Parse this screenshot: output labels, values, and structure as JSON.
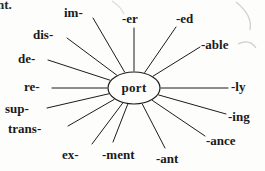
{
  "page": {
    "background_color": "#fdfdfc",
    "ink_color": "#1a1a1a",
    "clipped_fragment": "nt."
  },
  "diagram": {
    "type": "word-web",
    "center": {
      "word": "port",
      "cx": 134,
      "cy": 88,
      "rx": 26,
      "ry": 16
    },
    "spokes": [
      {
        "label": "im-",
        "name": "affix-im",
        "text_x": 64,
        "text_y": 6,
        "line_x": 93,
        "line_y": 18,
        "align": "left"
      },
      {
        "label": "-er",
        "name": "affix-er",
        "text_x": 122,
        "text_y": 12,
        "line_x": 134,
        "line_y": 28,
        "align": "left"
      },
      {
        "label": "-ed",
        "name": "affix-ed",
        "text_x": 176,
        "text_y": 12,
        "line_x": 176,
        "line_y": 27,
        "align": "left"
      },
      {
        "label": "-able",
        "name": "affix-able",
        "text_x": 201,
        "text_y": 38,
        "line_x": 200,
        "line_y": 47,
        "align": "left"
      },
      {
        "label": "-ly",
        "name": "affix-ly",
        "text_x": 231,
        "text_y": 80,
        "line_x": 228,
        "line_y": 88,
        "align": "left"
      },
      {
        "label": "-ing",
        "name": "affix-ing",
        "text_x": 228,
        "text_y": 110,
        "line_x": 226,
        "line_y": 114,
        "align": "left"
      },
      {
        "label": "-ance",
        "name": "affix-ance",
        "text_x": 206,
        "text_y": 134,
        "line_x": 205,
        "line_y": 136,
        "align": "left"
      },
      {
        "label": "-ant",
        "name": "affix-ant",
        "text_x": 156,
        "text_y": 152,
        "line_x": 165,
        "line_y": 148,
        "align": "left"
      },
      {
        "label": "-ment",
        "name": "affix-ment",
        "text_x": 102,
        "text_y": 148,
        "line_x": 113,
        "line_y": 142,
        "align": "left"
      },
      {
        "label": "ex-",
        "name": "affix-ex",
        "text_x": 62,
        "text_y": 148,
        "line_x": 92,
        "line_y": 144,
        "align": "left"
      },
      {
        "label": "trans-",
        "name": "affix-trans",
        "text_x": 8,
        "text_y": 122,
        "line_x": 68,
        "line_y": 126,
        "align": "left"
      },
      {
        "label": "sup-",
        "name": "affix-sup",
        "text_x": 5,
        "text_y": 102,
        "line_x": 47,
        "line_y": 108,
        "align": "left"
      },
      {
        "label": "re-",
        "name": "affix-re",
        "text_x": 24,
        "text_y": 80,
        "line_x": 52,
        "line_y": 88,
        "align": "left"
      },
      {
        "label": "de-",
        "name": "affix-de",
        "text_x": 18,
        "text_y": 52,
        "line_x": 48,
        "line_y": 60,
        "align": "left"
      },
      {
        "label": "dis-",
        "name": "affix-dis",
        "text_x": 33,
        "text_y": 28,
        "line_x": 67,
        "line_y": 38,
        "align": "left"
      }
    ]
  }
}
